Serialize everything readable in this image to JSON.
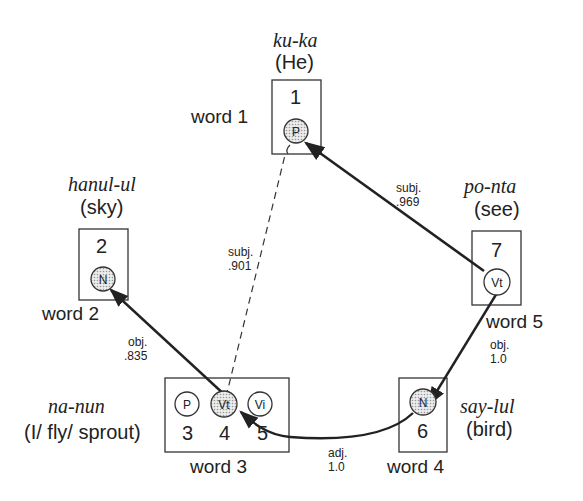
{
  "colors": {
    "ink": "#222222",
    "node_fill_active": "#d4d4d4",
    "background": "#ffffff"
  },
  "words": [
    {
      "id": "word1",
      "label": "word 1",
      "korean": "ku-ka",
      "gloss": "(He)",
      "units": [
        {
          "num": "1",
          "tag": "P",
          "active": true
        }
      ]
    },
    {
      "id": "word2",
      "label": "word 2",
      "korean": "hanul-ul",
      "gloss": "(sky)",
      "units": [
        {
          "num": "2",
          "tag": "N",
          "active": true
        }
      ]
    },
    {
      "id": "word3",
      "label": "word 3",
      "korean": "na-nun",
      "gloss": "(I/ fly/ sprout)",
      "units": [
        {
          "num": "3",
          "tag": "P",
          "active": false
        },
        {
          "num": "4",
          "tag": "Vt",
          "active": true
        },
        {
          "num": "5",
          "tag": "Vi",
          "active": false
        }
      ]
    },
    {
      "id": "word4",
      "label": "word 4",
      "korean": "say-lul",
      "gloss": "(bird)",
      "units": [
        {
          "num": "6",
          "tag": "N",
          "active": true
        }
      ]
    },
    {
      "id": "word5",
      "label": "word 5",
      "korean": "po-nta",
      "gloss": "(see)",
      "units": [
        {
          "num": "7",
          "tag": "Vt",
          "active": false
        }
      ]
    }
  ],
  "edges": [
    {
      "from": "7",
      "to": "1",
      "relation": "subj.",
      "weight": ".969",
      "style": "solid"
    },
    {
      "from": "4",
      "to": "1",
      "relation": "subj.",
      "weight": ".901",
      "style": "dashed"
    },
    {
      "from": "4",
      "to": "2",
      "relation": "obj.",
      "weight": ".835",
      "style": "solid"
    },
    {
      "from": "7",
      "to": "6",
      "relation": "obj.",
      "weight": "1.0",
      "style": "solid"
    },
    {
      "from": "6",
      "to": "4",
      "relation": "adj.",
      "weight": "1.0",
      "style": "solid"
    }
  ]
}
